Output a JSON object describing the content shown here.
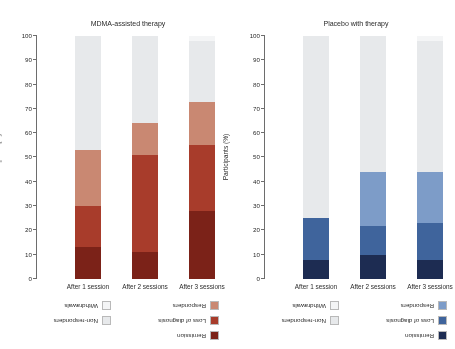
{
  "figure": {
    "rotation_note": "image rendered upside-down (180 degrees)",
    "y_axis_title": "Participants (%)",
    "y_ticks": [
      "0",
      "10",
      "20",
      "30",
      "40",
      "50",
      "60",
      "70",
      "80",
      "90",
      "100"
    ],
    "categories": [
      "After 1 session",
      "After 2 sessions",
      "After 3 sessions"
    ]
  },
  "panels": [
    {
      "id": "mdma",
      "title": "MDMA-assisted therapy",
      "legend": [
        {
          "label": "Remission",
          "color": "#7b2218"
        },
        {
          "label": "Loss of diagnosis",
          "color": "#a83c2b"
        },
        {
          "label": "Responders",
          "color": "#c98872"
        },
        {
          "label": "Non-responders",
          "color": "#e7e9eb"
        },
        {
          "label": "Withdrawals",
          "color": "#f4f5f6"
        }
      ]
    },
    {
      "id": "placebo",
      "title": "Placebo with therapy",
      "legend": [
        {
          "label": "Remission",
          "color": "#1d2c52"
        },
        {
          "label": "Loss of diagnosis",
          "color": "#3f649c"
        },
        {
          "label": "Responders",
          "color": "#7d9cc8"
        },
        {
          "label": "Non-responders",
          "color": "#e7e9eb"
        },
        {
          "label": "Withdrawals",
          "color": "#f4f5f6"
        }
      ]
    }
  ],
  "chart_data": {
    "type": "bar",
    "xlabel": "",
    "ylabel": "Participants (%)",
    "ylim": [
      0,
      100
    ],
    "stacked": true,
    "grid": false,
    "legend_position": "top",
    "categories": [
      "After 1 session",
      "After 2 sessions",
      "After 3 sessions"
    ],
    "panels": [
      {
        "name": "MDMA-assisted therapy",
        "series": [
          {
            "name": "Remission",
            "color": "#7b2218",
            "values": [
              13,
              11,
              28
            ]
          },
          {
            "name": "Loss of diagnosis",
            "color": "#a83c2b",
            "values": [
              17,
              40,
              27
            ]
          },
          {
            "name": "Responders",
            "color": "#c98872",
            "values": [
              23,
              13,
              18
            ]
          },
          {
            "name": "Non-responders",
            "color": "#e7e9eb",
            "values": [
              47,
              36,
              25
            ]
          },
          {
            "name": "Withdrawals",
            "color": "#f4f5f6",
            "values": [
              0,
              0,
              2
            ]
          }
        ]
      },
      {
        "name": "Placebo with therapy",
        "series": [
          {
            "name": "Remission",
            "color": "#1d2c52",
            "values": [
              8,
              10,
              8
            ]
          },
          {
            "name": "Loss of diagnosis",
            "color": "#3f649c",
            "values": [
              17,
              12,
              15
            ]
          },
          {
            "name": "Responders",
            "color": "#7d9cc8",
            "values": [
              0,
              22,
              21
            ]
          },
          {
            "name": "Non-responders",
            "color": "#e7e9eb",
            "values": [
              75,
              56,
              54
            ]
          },
          {
            "name": "Withdrawals",
            "color": "#f4f5f6",
            "values": [
              0,
              0,
              2
            ]
          }
        ]
      }
    ]
  }
}
